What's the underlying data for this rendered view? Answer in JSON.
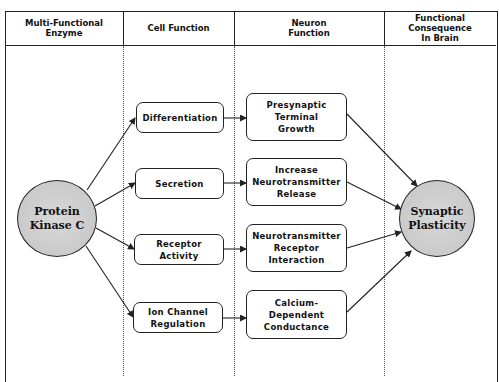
{
  "headers": [
    {
      "label": "Multi-Functional\nEnzyme"
    },
    {
      "label": "Cell Function"
    },
    {
      "label": "Neuron\nFunction"
    },
    {
      "label": "Functional\nConsequence\nIn Brain"
    }
  ],
  "source_node": {
    "label": "Protein\nKinase C"
  },
  "cell_functions": [
    {
      "label": "Differentiation"
    },
    {
      "label": "Secretion"
    },
    {
      "label": "Receptor\nActivity"
    },
    {
      "label": "Ion Channel\nRegulation"
    }
  ],
  "neuron_functions": [
    {
      "label": "Presynaptic\nTerminal\nGrowth"
    },
    {
      "label": "Increase\nNeurotransmitter\nRelease"
    },
    {
      "label": "Neurotransmitter\nReceptor\nInteraction"
    },
    {
      "label": "Calcium-\nDependent\nConductance"
    }
  ],
  "target_node": {
    "label": "Synaptic\nPlasticity"
  },
  "colors": {
    "line": "#222222",
    "circle_fill": "#cccccc",
    "background": "#ffffff"
  }
}
